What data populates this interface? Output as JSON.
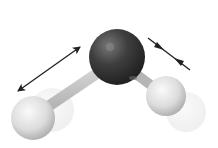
{
  "diagram": {
    "atoms": [
      {
        "element": "O",
        "role": "oxygen-atom",
        "cx": 117,
        "cy": 57,
        "r": 28,
        "color": "#3a3a3a"
      },
      {
        "element": "H",
        "role": "hydrogen-atom-left",
        "cx": 33,
        "cy": 118,
        "r": 22,
        "color": "#e6e6e6"
      },
      {
        "element": "H",
        "role": "hydrogen-atom-right",
        "cx": 166,
        "cy": 96,
        "r": 20,
        "color": "#e6e6e6"
      }
    ],
    "ghost_atoms": [
      {
        "role": "hydrogen-left-displaced",
        "cx": 52,
        "cy": 110,
        "r": 22
      },
      {
        "role": "hydrogen-right-displaced",
        "cx": 186,
        "cy": 112,
        "r": 20
      }
    ],
    "arrows": [
      {
        "role": "stretch-arrow-left",
        "type": "double-outward",
        "x1": 17,
        "y1": 92,
        "x2": 81,
        "y2": 46
      },
      {
        "role": "compress-arrow-right",
        "type": "double-inward",
        "x1": 148,
        "y1": 38,
        "x2": 190,
        "y2": 70
      }
    ]
  }
}
